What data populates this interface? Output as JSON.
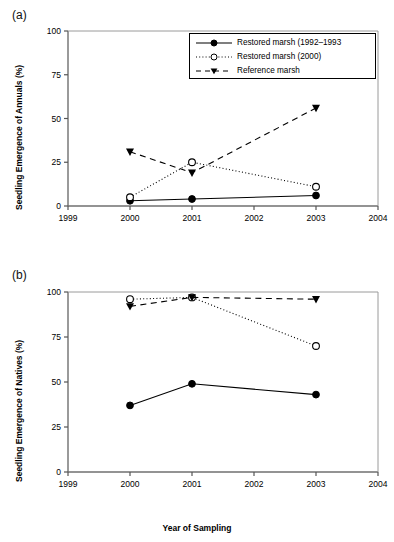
{
  "figure": {
    "panels": [
      {
        "id": "a",
        "label": "(a)",
        "ylabel": "Seedling Emergence of Annuals (%)",
        "xlabel": ""
      },
      {
        "id": "b",
        "label": "(b)",
        "ylabel": "Seedling Emergence of Natives (%)",
        "xlabel": "Year of Sampling"
      }
    ],
    "legend": {
      "items": [
        {
          "label": "Restored marsh (1992–1993",
          "marker": "filled-circle",
          "line": "solid"
        },
        {
          "label": "Restored marsh (2000)",
          "marker": "open-circle",
          "line": "dotted"
        },
        {
          "label": "Reference marsh",
          "marker": "filled-triangle-down",
          "line": "dashed"
        }
      ]
    }
  },
  "chart_data": [
    {
      "type": "line",
      "panel": "a",
      "title": "(a)",
      "xlabel": "",
      "ylabel": "Seedling Emergence of Annuals (%)",
      "x": [
        2000,
        2001,
        2003
      ],
      "xticks": [
        1999,
        2000,
        2001,
        2002,
        2003,
        2004
      ],
      "yticks": [
        0,
        25,
        50,
        75,
        100
      ],
      "xlim": [
        1999,
        2004
      ],
      "ylim": [
        0,
        100
      ],
      "grid": false,
      "legend_position": "top-right",
      "series": [
        {
          "name": "Restored marsh (1992–1993",
          "marker": "filled-circle",
          "line": "solid",
          "values": [
            3,
            4,
            6
          ]
        },
        {
          "name": "Restored marsh (2000)",
          "marker": "open-circle",
          "line": "dotted",
          "values": [
            5,
            25,
            11
          ]
        },
        {
          "name": "Reference marsh",
          "marker": "filled-triangle-down",
          "line": "dashed",
          "values": [
            31,
            19,
            56
          ]
        }
      ]
    },
    {
      "type": "line",
      "panel": "b",
      "title": "(b)",
      "xlabel": "Year of Sampling",
      "ylabel": "Seedling Emergence of Natives (%)",
      "x": [
        2000,
        2001,
        2003
      ],
      "xticks": [
        1999,
        2000,
        2001,
        2002,
        2003,
        2004
      ],
      "yticks": [
        0,
        25,
        50,
        75,
        100
      ],
      "xlim": [
        1999,
        2004
      ],
      "ylim": [
        0,
        100
      ],
      "grid": false,
      "legend_position": "none",
      "series": [
        {
          "name": "Restored marsh (1992–1993",
          "marker": "filled-circle",
          "line": "solid",
          "values": [
            37,
            49,
            43
          ]
        },
        {
          "name": "Restored marsh (2000)",
          "marker": "open-circle",
          "line": "dotted",
          "values": [
            96,
            97,
            70
          ]
        },
        {
          "name": "Reference marsh",
          "marker": "filled-triangle-down",
          "line": "dashed",
          "values": [
            92,
            97,
            96
          ]
        }
      ]
    }
  ]
}
